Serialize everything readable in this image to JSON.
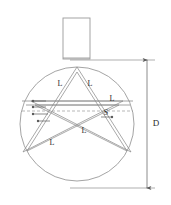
{
  "figure": {
    "background_color": "#ffffff",
    "line_color": "#8c8c8c",
    "dark_line_color": "#6e6e6e",
    "text_color": "#2b2b2b",
    "width": 171,
    "height": 205
  },
  "geometry": {
    "circle": {
      "cx": 77,
      "cy": 124,
      "r": 57
    },
    "neck": {
      "x": 63,
      "y": 18,
      "width": 27,
      "height": 41
    },
    "strip_offset": 3.2,
    "star_points": 5
  },
  "labels": {
    "arm_upper_left": "L",
    "arm_upper_right": "L",
    "chord_right": "L",
    "strip_width": "S",
    "arm_center": "L",
    "arm_lower_left": "L",
    "diameter": "D"
  },
  "label_positions": {
    "arm_upper_left": {
      "x": 60,
      "y": 84
    },
    "arm_upper_right": {
      "x": 90,
      "y": 84
    },
    "chord_right": {
      "x": 112,
      "y": 99
    },
    "strip_width": {
      "x": 106,
      "y": 113
    },
    "arm_center": {
      "x": 84,
      "y": 131
    },
    "arm_lower_left": {
      "x": 52,
      "y": 143
    },
    "diameter": {
      "x": 156,
      "y": 124
    }
  },
  "dimension": {
    "label": "D",
    "line_x": 147,
    "top_y": 60,
    "bottom_y": 188,
    "extension_top": {
      "x1": 70,
      "y1": 60,
      "x2": 155,
      "y2": 60
    },
    "extension_bottom": {
      "x1": 70,
      "y1": 188,
      "x2": 155,
      "y2": 188
    }
  },
  "annotations": {
    "dashed_center_line": {
      "x1": 22,
      "y1": 111,
      "x2": 133,
      "y2": 111
    },
    "marker_count": 5
  }
}
